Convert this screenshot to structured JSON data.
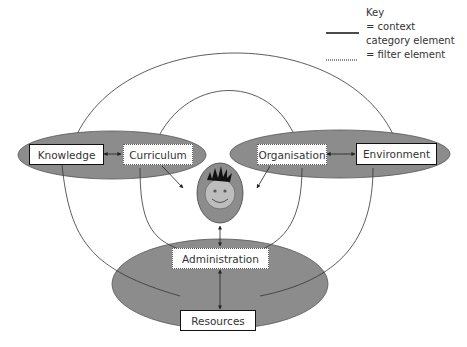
{
  "key": {
    "title": "Key",
    "solid_label_line1": "= context",
    "solid_label_line2": "category element",
    "dotted_label": "= filter element"
  },
  "nodes": {
    "knowledge": {
      "label": "Knowledge",
      "type": "context"
    },
    "curriculum": {
      "label": "Curriculum",
      "type": "filter"
    },
    "organisation": {
      "label": "Organisation",
      "type": "filter"
    },
    "environment": {
      "label": "Environment",
      "type": "context"
    },
    "administration": {
      "label": "Administration",
      "type": "filter"
    },
    "resources": {
      "label": "Resources",
      "type": "context"
    }
  },
  "center": {
    "icon": "child-face-icon"
  },
  "colors": {
    "ellipse_fill": "#8c8c8c",
    "face_fill": "#bdbdbd",
    "stroke": "#222222"
  }
}
